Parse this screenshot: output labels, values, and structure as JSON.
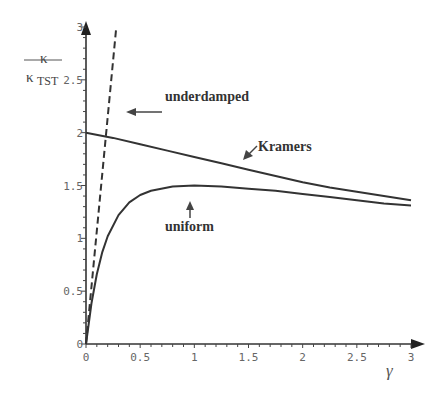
{
  "chart_data": {
    "type": "line",
    "title": "",
    "xlabel": "γ",
    "ylabel_numerator": "κ",
    "ylabel_denominator": "κ",
    "ylabel_denominator_subscript": "TST",
    "xlim": [
      0,
      3
    ],
    "ylim": [
      0,
      3
    ],
    "grid": false,
    "x_ticks": [
      "0",
      "0.5",
      "1",
      "1.5",
      "2",
      "2.5",
      "3"
    ],
    "y_ticks": [
      "0",
      "0.5",
      "1",
      "1.5",
      "2",
      "2.5",
      "3"
    ],
    "series": [
      {
        "name": "underdamped",
        "style": "dashed",
        "x": [
          0,
          0.28
        ],
        "y": [
          0,
          3.0
        ]
      },
      {
        "name": "Kramers",
        "style": "solid",
        "x": [
          0,
          0.25,
          0.5,
          0.75,
          1.0,
          1.25,
          1.5,
          1.75,
          2.0,
          2.25,
          2.5,
          2.75,
          3.0
        ],
        "y": [
          2.0,
          1.95,
          1.89,
          1.83,
          1.77,
          1.71,
          1.65,
          1.59,
          1.53,
          1.48,
          1.44,
          1.4,
          1.36
        ]
      },
      {
        "name": "uniform",
        "style": "solid",
        "x": [
          0,
          0.05,
          0.1,
          0.15,
          0.2,
          0.3,
          0.4,
          0.5,
          0.6,
          0.8,
          1.0,
          1.25,
          1.5,
          1.75,
          2.0,
          2.25,
          2.5,
          2.75,
          3.0
        ],
        "y": [
          0,
          0.38,
          0.66,
          0.87,
          1.02,
          1.22,
          1.34,
          1.41,
          1.45,
          1.49,
          1.5,
          1.49,
          1.47,
          1.45,
          1.42,
          1.39,
          1.36,
          1.33,
          1.31
        ]
      }
    ],
    "annotations": [
      {
        "text": "underdamped",
        "arrow": "left"
      },
      {
        "text": "Kramers",
        "arrow": "down-left"
      },
      {
        "text": "uniform",
        "arrow": "up"
      }
    ]
  }
}
